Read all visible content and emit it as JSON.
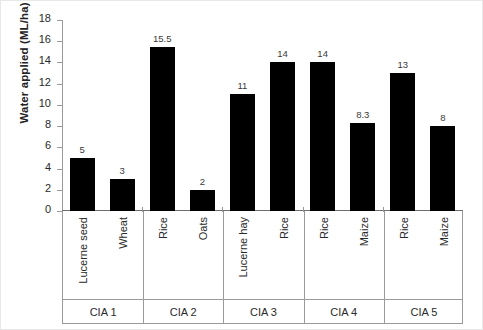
{
  "chart_data": {
    "type": "bar",
    "title": "",
    "xlabel": "",
    "ylabel": "Water applied (ML/ha)",
    "ylim": [
      0,
      18
    ],
    "ytick_step": 2,
    "yticks": [
      18,
      16,
      14,
      12,
      10,
      8,
      6,
      4,
      2,
      0
    ],
    "grid": false,
    "legend": "none",
    "bar_color": "#000000",
    "categories": [
      "Lucerne seed",
      "Wheat",
      "Rice",
      "Oats",
      "Lucerne hay",
      "Rice",
      "Rice",
      "Maize",
      "Rice",
      "Maize"
    ],
    "values": [
      5,
      3,
      15.5,
      2,
      11,
      14,
      14,
      8.3,
      13,
      8
    ],
    "value_labels": [
      "5",
      "3",
      "15.5",
      "2",
      "11",
      "14",
      "14",
      "8.3",
      "13",
      "8"
    ],
    "groups": [
      {
        "label": "CIA 1",
        "categories": [
          "Lucerne seed",
          "Wheat"
        ],
        "values": [
          5,
          3
        ]
      },
      {
        "label": "CIA 2",
        "categories": [
          "Rice",
          "Oats"
        ],
        "values": [
          15.5,
          2
        ]
      },
      {
        "label": "CIA 3",
        "categories": [
          "Lucerne hay",
          "Rice"
        ],
        "values": [
          11,
          14
        ]
      },
      {
        "label": "CIA 4",
        "categories": [
          "Rice",
          "Maize"
        ],
        "values": [
          14,
          8.3
        ]
      },
      {
        "label": "CIA 5",
        "categories": [
          "Rice",
          "Maize"
        ],
        "values": [
          13,
          8
        ]
      }
    ]
  }
}
